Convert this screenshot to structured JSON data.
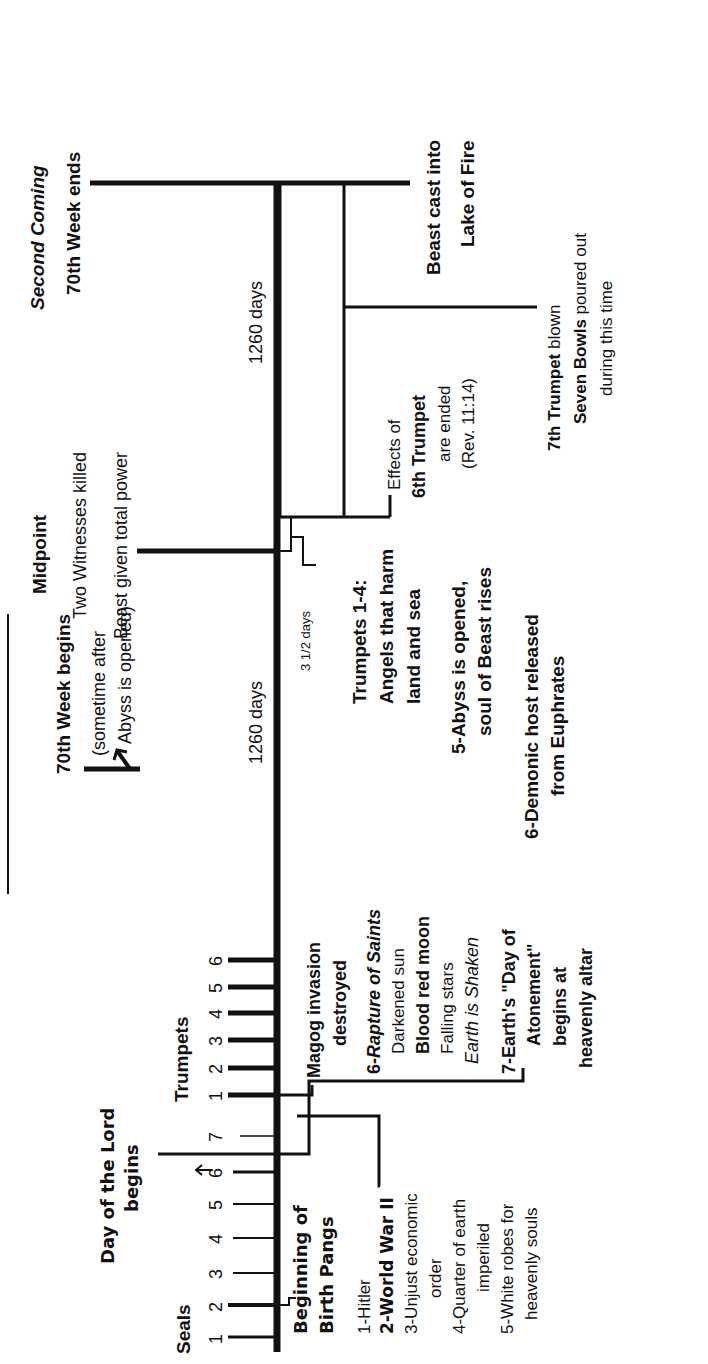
{
  "colors": {
    "ink": "#111111",
    "background": "#ffffff"
  },
  "timeline": {
    "durations": {
      "first_half": "1260 days",
      "second_half": "1260 days",
      "witnesses_dead": "3 1/2 days"
    },
    "seals": {
      "label": "Seals",
      "numbers": [
        "1",
        "2",
        "3",
        "4",
        "5",
        "6",
        "7"
      ],
      "events": {
        "beginning": [
          "Beginning of",
          "Birth Pangs"
        ],
        "list": [
          "1-Hitler",
          "2-World War II",
          "3-Unjust economic",
          "order",
          "4-Quarter of earth",
          "imperiled",
          "5-White robes for",
          "heavenly souls"
        ],
        "sixth": {
          "head": "6-",
          "rapture": "Rapture of Saints",
          "lines": [
            "Darkened sun",
            "Blood red moon",
            "Falling stars"
          ],
          "shaken": "Earth is Shaken"
        },
        "seventh": [
          "7-Earth's \"Day of",
          "Atonement\"",
          "begins at",
          "heavenly altar"
        ]
      }
    },
    "day_of_lord": [
      "Day of the Lord",
      "begins"
    ],
    "trumpets": {
      "label": "Trumpets",
      "numbers": [
        "1",
        "2",
        "3",
        "4",
        "5",
        "6"
      ],
      "magog": [
        "Magog invasion",
        "destroyed"
      ],
      "events": [
        "Trumpets 1-4:",
        "Angels that harm",
        "land and sea",
        "5-Abyss is opened,",
        "soul of Beast rises",
        "6-Demonic host released",
        "from Euphrates"
      ]
    },
    "week_begins": [
      "70th Week begins",
      "(sometime after",
      "Abyss is opened)"
    ],
    "midpoint": {
      "title": "Midpoint",
      "lines": [
        "Two Witnesses killed",
        "Beast given total power"
      ]
    },
    "sixth_trumpet_ended": {
      "pre": "Effects of",
      "bold": "6th Trumpet",
      "lines": [
        "are ended",
        "(Rev. 11:14)"
      ]
    },
    "seventh_trumpet": {
      "bold1": "7th Trumpet",
      "rest1": " blown",
      "bold2": "Seven Bowls",
      "rest2": " poured out",
      "line3": "during this time"
    },
    "beast_cast": [
      "Beast cast into",
      "Lake of Fire"
    ],
    "end": {
      "title": "Second Coming",
      "subtitle": "70th Week ends"
    }
  }
}
